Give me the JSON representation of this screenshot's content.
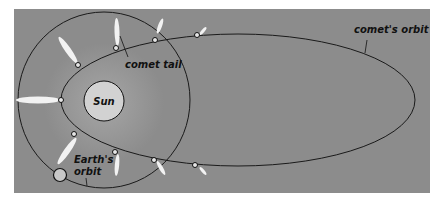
{
  "diagram": {
    "type": "comet orbit around the Sun",
    "labels": {
      "sun": "Sun",
      "comet_tail": "comet tail",
      "comets_orbit": "comet's orbit",
      "earths_orbit_line1": "Earth's",
      "earths_orbit_line2": "orbit"
    },
    "colors": {
      "background": "#8c8c8c",
      "sun_fill": "#d2d2d2",
      "orbit_stroke": "#1a1a1a",
      "tail": "#f4f4f4"
    }
  }
}
